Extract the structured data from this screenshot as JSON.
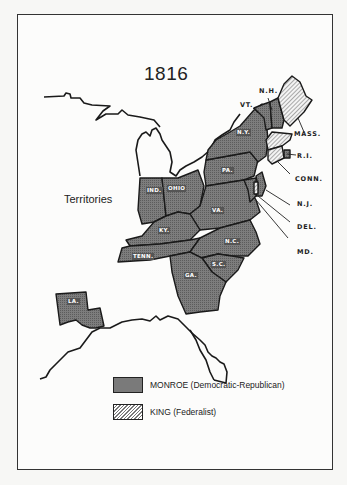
{
  "map": {
    "title": "1816",
    "region_label": "Territories",
    "colors": {
      "monroe_fill": "#7a7a7a",
      "king_fill": "#d8d8d8",
      "outline": "#1a1a1a"
    },
    "states_inline": [
      {
        "abbr": "N.Y.",
        "party": "Monroe"
      },
      {
        "abbr": "PA.",
        "party": "Monroe"
      },
      {
        "abbr": "IND.",
        "party": "Monroe"
      },
      {
        "abbr": "OHIO",
        "party": "Monroe"
      },
      {
        "abbr": "VA.",
        "party": "Monroe"
      },
      {
        "abbr": "KY.",
        "party": "Monroe"
      },
      {
        "abbr": "TENN.",
        "party": "Monroe"
      },
      {
        "abbr": "N.C.",
        "party": "Monroe"
      },
      {
        "abbr": "S.C.",
        "party": "Monroe"
      },
      {
        "abbr": "GA.",
        "party": "Monroe"
      },
      {
        "abbr": "LA.",
        "party": "Monroe"
      }
    ],
    "states_callout": [
      {
        "abbr": "N.H.",
        "party": "Monroe"
      },
      {
        "abbr": "VT.",
        "party": "Monroe"
      },
      {
        "abbr": "MASS.",
        "party": "King"
      },
      {
        "abbr": "R.I.",
        "party": "Monroe"
      },
      {
        "abbr": "CONN.",
        "party": "King"
      },
      {
        "abbr": "N.J.",
        "party": "Monroe"
      },
      {
        "abbr": "DEL.",
        "party": "King"
      },
      {
        "abbr": "MD.",
        "party": "Monroe"
      }
    ]
  },
  "legend": {
    "items": [
      {
        "label": "MONROE  (Democratic-Republican)",
        "pattern": "crosshatch-dark"
      },
      {
        "label": "KING  (Federalist)",
        "pattern": "diagonal-hatch"
      }
    ]
  }
}
